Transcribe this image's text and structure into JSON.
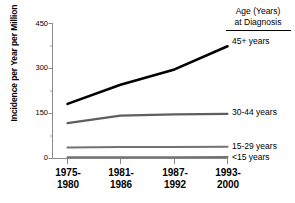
{
  "chart_data": {
    "type": "line",
    "title": "",
    "xlabel": "",
    "ylabel": "Incidence per Year per Million",
    "categories": [
      "1975-\n1980",
      "1981-\n1986",
      "1987-\n1992",
      "1993-\n2000"
    ],
    "category_lines": [
      [
        "1975-",
        "1980"
      ],
      [
        "1981-",
        "1986"
      ],
      [
        "1987-",
        "1992"
      ],
      [
        "1993-",
        "2000"
      ]
    ],
    "ylim": [
      0,
      450
    ],
    "yticks": [
      0,
      150,
      300,
      450
    ],
    "ytick_labels": [
      "0",
      "150",
      "300",
      "450"
    ],
    "yminor_ticks": [
      75,
      225,
      375
    ],
    "grid": false,
    "legend_position": "right",
    "legend_title_lines": [
      "Age (Years)",
      "at Diagnosis"
    ],
    "series": [
      {
        "name": "45+ years",
        "color": "#000000",
        "width": 2.6,
        "values": [
          182,
          246,
          297,
          374
        ]
      },
      {
        "name": "30-44 years",
        "color": "#5e5e5e",
        "width": 2.2,
        "values": [
          118,
          143,
          147,
          149
        ]
      },
      {
        "name": "15-29 years",
        "color": "#737373",
        "width": 2.0,
        "values": [
          37,
          38,
          38,
          39
        ]
      },
      {
        "name": "<15 years",
        "color": "#737373",
        "width": 2.0,
        "values": [
          4,
          4,
          4,
          5
        ]
      }
    ]
  },
  "axes": {
    "ytitle": "Incidence per Year per Million",
    "ytick_0": "0",
    "ytick_150": "150",
    "ytick_300": "300",
    "ytick_450": "450"
  },
  "legend": {
    "title_line1": "Age (Years)",
    "title_line2": "at Diagnosis",
    "item_45plus": "45+ years",
    "item_30_44": "30-44 years",
    "item_15_29": "15-29 years",
    "item_under15": "<15 years"
  },
  "xaxis": {
    "c1_top": "1975-",
    "c1_bottom": "1980",
    "c2_top": "1981-",
    "c2_bottom": "1986",
    "c3_top": "1987-",
    "c3_bottom": "1992",
    "c4_top": "1993-",
    "c4_bottom": "2000"
  },
  "colors": {
    "series_45plus": "#000000",
    "series_30_44": "#5e5e5e",
    "series_15_29": "#737373",
    "series_under15": "#737373",
    "axis": "#8a8a8a",
    "text": "#000000"
  }
}
